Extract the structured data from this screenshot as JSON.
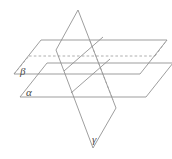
{
  "figure": {
    "background_color": "#ffffff",
    "line_color": "#8c8c8c",
    "hidden_line_color": "#9a9a9a",
    "label_color": "#4a4a4a",
    "labels": {
      "beta": "β",
      "alpha": "α",
      "gamma": "γ"
    },
    "label_positions": {
      "beta": {
        "x": 20,
        "y": 75
      },
      "alpha": {
        "x": 26,
        "y": 96
      },
      "gamma": {
        "x": 92,
        "y": 143
      }
    },
    "planes": [
      {
        "name": "beta",
        "label": "β",
        "kind": "horizontal-parallelogram",
        "orientation": "upper",
        "vertices": [
          {
            "x": 14,
            "y": 74
          },
          {
            "x": 41,
            "y": 40
          },
          {
            "x": 167,
            "y": 40
          },
          {
            "x": 140,
            "y": 74
          }
        ],
        "hidden_segments": [
          {
            "x1": 29,
            "y1": 56,
            "x2": 155,
            "y2": 56
          }
        ]
      },
      {
        "name": "alpha",
        "label": "α",
        "kind": "horizontal-parallelogram",
        "orientation": "lower",
        "vertices": [
          {
            "x": 20,
            "y": 97
          },
          {
            "x": 47,
            "y": 63
          },
          {
            "x": 173,
            "y": 63
          },
          {
            "x": 146,
            "y": 97
          }
        ],
        "hidden_segments": []
      },
      {
        "name": "gamma",
        "label": "γ",
        "kind": "slanted-parallelogram",
        "orientation": "vertical",
        "vertices": [
          {
            "x": 78,
            "y": 10
          },
          {
            "x": 116,
            "y": 108
          },
          {
            "x": 93,
            "y": 148
          },
          {
            "x": 56,
            "y": 50
          }
        ],
        "hidden_segments": []
      }
    ],
    "intersection_lines": [
      {
        "name": "gamma-beta",
        "x1": 64,
        "y1": 71,
        "x2": 103,
        "y2": 37,
        "style": "solid"
      },
      {
        "name": "gamma-alpha",
        "x1": 71,
        "y1": 93,
        "x2": 110,
        "y2": 59,
        "style": "solid"
      }
    ]
  }
}
